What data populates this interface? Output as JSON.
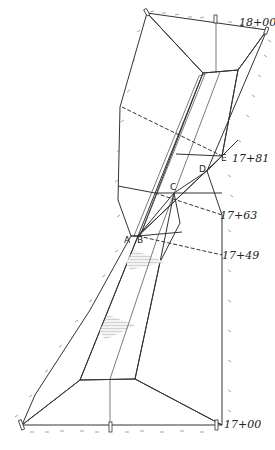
{
  "figure": {
    "type": "earthwork transition perspective sketch (cut to fill)",
    "stations": [
      {
        "id": "sta-1800",
        "label": "18+00"
      },
      {
        "id": "sta-1781",
        "label": "17+81"
      },
      {
        "id": "sta-1763",
        "label": "17+63"
      },
      {
        "id": "sta-1749",
        "label": "17+49"
      },
      {
        "id": "sta-1700",
        "label": "17+00"
      }
    ],
    "points": [
      {
        "id": "A",
        "label": "A"
      },
      {
        "id": "B",
        "label": "B"
      },
      {
        "id": "C",
        "label": "C"
      },
      {
        "id": "D",
        "label": "D"
      },
      {
        "id": "E",
        "label": "E"
      }
    ],
    "colors": {
      "ink": "#333333",
      "fill_light": "#e6e6e6",
      "fill_medium": "#cfcfcf",
      "fill_dark": "#a8a8a8",
      "paper": "#ffffff"
    }
  }
}
